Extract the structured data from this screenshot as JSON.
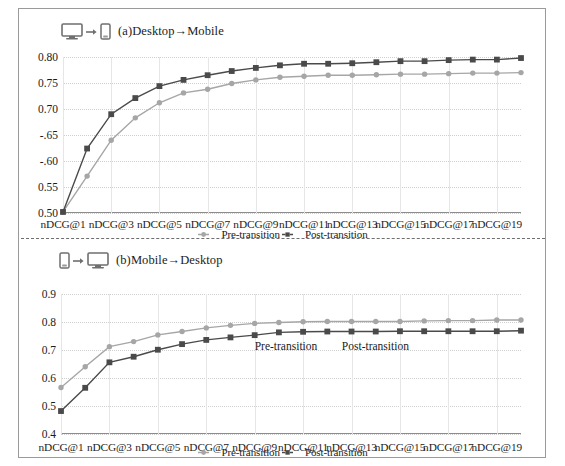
{
  "figure": {
    "panels": [
      {
        "id": "panel-a",
        "caption": "(a)Desktop→Mobile",
        "icon_from": "desktop-monitor-icon",
        "icon_arrow": "arrow-right-icon",
        "icon_to": "mobile-phone-icon",
        "legend": [
          {
            "label": "Pre-transition",
            "marker": "circle",
            "color": "#a6a6a6"
          },
          {
            "label": "Post-transition",
            "marker": "square",
            "color": "#4a4a4a"
          }
        ]
      },
      {
        "id": "panel-b",
        "caption": "(b)Mobile→Desktop",
        "icon_from": "mobile-phone-icon",
        "icon_arrow": "arrow-right-icon",
        "icon_to": "desktop-monitor-icon",
        "legend": [
          {
            "label": "Pre-transition",
            "marker": "circle",
            "color": "#a6a6a6"
          },
          {
            "label": "Post-transition",
            "marker": "square",
            "color": "#4a4a4a"
          }
        ],
        "annotations": [
          {
            "text": "Pre-transition",
            "x": 9,
            "y": 0.737
          },
          {
            "text": "Post-transition",
            "x": 12.6,
            "y": 0.737
          }
        ]
      }
    ]
  },
  "chart_data": [
    {
      "type": "line",
      "title": "(a)Desktop→Mobile",
      "xlabel": "",
      "ylabel": "",
      "grid": true,
      "legend_position": "bottom",
      "ylim": [
        0.5,
        0.8
      ],
      "yticks": [
        0.5,
        0.55,
        0.6,
        0.65,
        0.7,
        0.75,
        0.8
      ],
      "ytick_labels": [
        "0.50",
        "0.55",
        "-.60",
        "-.65",
        "0.70",
        "0.75",
        "0.80"
      ],
      "x": [
        1,
        2,
        3,
        4,
        5,
        6,
        7,
        8,
        9,
        10,
        11,
        12,
        13,
        14,
        15,
        16,
        17,
        18,
        19,
        20
      ],
      "xtick_labels": [
        "nDCG@1",
        "nDCG@3",
        "nDCG@5",
        "nDCG@7",
        "nDCG@9",
        "nDCG@11",
        "nDCG@13",
        "nDCG@15",
        "nDCG@17",
        "nDCG@19"
      ],
      "xtick_positions": [
        1,
        3,
        5,
        7,
        9,
        11,
        13,
        15,
        17,
        19
      ],
      "series": [
        {
          "name": "Pre-transition",
          "marker": "circle",
          "color": "#a6a6a6",
          "values": [
            0.502,
            0.571,
            0.64,
            0.683,
            0.712,
            0.731,
            0.738,
            0.749,
            0.756,
            0.761,
            0.763,
            0.765,
            0.765,
            0.766,
            0.767,
            0.767,
            0.768,
            0.769,
            0.769,
            0.77
          ]
        },
        {
          "name": "Post-transition",
          "marker": "square",
          "color": "#4a4a4a",
          "values": [
            0.502,
            0.624,
            0.69,
            0.721,
            0.744,
            0.756,
            0.765,
            0.773,
            0.779,
            0.784,
            0.787,
            0.787,
            0.788,
            0.79,
            0.792,
            0.792,
            0.794,
            0.795,
            0.795,
            0.798
          ]
        }
      ]
    },
    {
      "type": "line",
      "title": "(b)Mobile→Desktop",
      "xlabel": "",
      "ylabel": "",
      "grid": true,
      "legend_position": "bottom",
      "ylim": [
        0.4,
        0.9
      ],
      "yticks": [
        0.4,
        0.5,
        0.6,
        0.7,
        0.8,
        0.9
      ],
      "ytick_labels": [
        "0.4",
        "0.5",
        "0.6",
        "0.7",
        "0.8",
        "0.9"
      ],
      "x": [
        1,
        2,
        3,
        4,
        5,
        6,
        7,
        8,
        9,
        10,
        11,
        12,
        13,
        14,
        15,
        16,
        17,
        18,
        19,
        20
      ],
      "xtick_labels": [
        "nDCG@1",
        "nDCG@3",
        "nDCG@5",
        "nDCG@7",
        "nDCG@9",
        "nDCG@11",
        "nDCG@13",
        "nDCG@15",
        "nDCG@17",
        "nDCG@19"
      ],
      "xtick_positions": [
        1,
        3,
        5,
        7,
        9,
        11,
        13,
        15,
        17,
        19
      ],
      "series": [
        {
          "name": "Pre-transition",
          "marker": "circle",
          "color": "#a6a6a6",
          "values": [
            0.566,
            0.64,
            0.712,
            0.73,
            0.754,
            0.766,
            0.779,
            0.788,
            0.795,
            0.798,
            0.801,
            0.802,
            0.802,
            0.802,
            0.802,
            0.804,
            0.805,
            0.805,
            0.807,
            0.807
          ]
        },
        {
          "name": "Post-transition",
          "marker": "square",
          "color": "#4a4a4a",
          "values": [
            0.482,
            0.565,
            0.656,
            0.676,
            0.701,
            0.721,
            0.736,
            0.745,
            0.753,
            0.763,
            0.765,
            0.766,
            0.766,
            0.766,
            0.767,
            0.767,
            0.767,
            0.767,
            0.767,
            0.769
          ]
        }
      ]
    }
  ]
}
